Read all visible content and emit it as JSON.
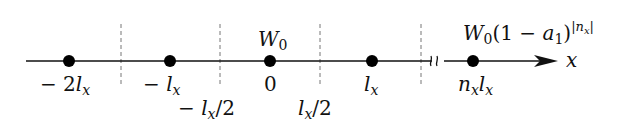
{
  "diagram": {
    "axis": {
      "label": "x",
      "y": 61,
      "x_start": 26,
      "x_end": 557,
      "break_x": 438
    },
    "colors": {
      "line": "#111111",
      "dashed": "#777777",
      "dot": "#000000",
      "background": "#ffffff"
    },
    "points": [
      {
        "x": 69,
        "label": "− 2lₓ",
        "label_parts": [
          "− 2",
          "l",
          "x"
        ]
      },
      {
        "x": 170,
        "label": "− lₓ",
        "label_parts": [
          "− ",
          "l",
          "x"
        ]
      },
      {
        "x": 270,
        "label": "0",
        "label_parts": [
          "0"
        ]
      },
      {
        "x": 372,
        "label": "lₓ",
        "label_parts": [
          "",
          "l",
          "x"
        ]
      },
      {
        "x": 473,
        "label": "nₓlₓ",
        "label_parts": [
          "n",
          "x",
          "l",
          "x"
        ]
      }
    ],
    "dashed_lines": [
      {
        "x": 121,
        "label": ""
      },
      {
        "x": 220,
        "label": "− lₓ/2"
      },
      {
        "x": 320,
        "label": "lₓ/2"
      },
      {
        "x": 421,
        "label": ""
      }
    ],
    "annotations": {
      "center_weight": {
        "base": "W",
        "sub": "0"
      },
      "far_weight": {
        "base": "W",
        "sub": "0",
        "paren": "(1 − a",
        "paren_sub": "1",
        "close": ")",
        "sup": "|n",
        "sup_sub": "x",
        "sup_close": "|"
      }
    }
  }
}
